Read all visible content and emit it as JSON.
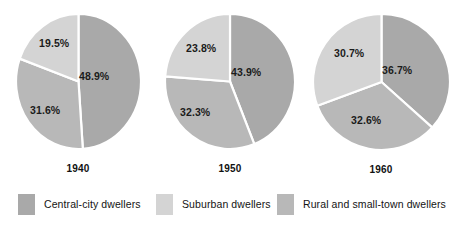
{
  "chart_data": {
    "type": "pie",
    "title": "",
    "subtitle": "",
    "xlabel": "",
    "ylabel": "",
    "legend_position": "bottom",
    "grid": false,
    "categories": [
      "Central-city dwellers",
      "Suburban dwellers",
      "Rural and small-town dwellers"
    ],
    "colors": [
      "#a9a9a9",
      "#d4d4d4",
      "#b8b8b8"
    ],
    "divider_color": "#ffffff",
    "charts": [
      {
        "label": "1940",
        "slices": [
          {
            "category": "Central-city dwellers",
            "value": 48.9,
            "display": "48.9%"
          },
          {
            "category": "Rural and small-town dwellers",
            "value": 31.6,
            "display": "31.6%"
          },
          {
            "category": "Suburban dwellers",
            "value": 19.5,
            "display": "19.5%"
          }
        ]
      },
      {
        "label": "1950",
        "slices": [
          {
            "category": "Central-city dwellers",
            "value": 43.9,
            "display": "43.9%"
          },
          {
            "category": "Rural and small-town dwellers",
            "value": 32.3,
            "display": "32.3%"
          },
          {
            "category": "Suburban dwellers",
            "value": 23.8,
            "display": "23.8%"
          }
        ]
      },
      {
        "label": "1960",
        "slices": [
          {
            "category": "Central-city dwellers",
            "value": 36.7,
            "display": "36.7%"
          },
          {
            "category": "Rural and small-town dwellers",
            "value": 32.6,
            "display": "32.6%"
          },
          {
            "category": "Suburban dwellers",
            "value": 30.7,
            "display": "30.7%"
          }
        ]
      }
    ]
  },
  "pies": [
    {
      "year": "1940",
      "p1": "48.9%",
      "p2": "31.6%",
      "p3": "19.5%"
    },
    {
      "year": "1950",
      "p1": "43.9%",
      "p2": "32.3%",
      "p3": "23.8%"
    },
    {
      "year": "1960",
      "p1": "36.7%",
      "p2": "32.6%",
      "p3": "30.7%"
    }
  ],
  "legend": {
    "items": [
      {
        "label": "Central-city dwellers",
        "color": "#a9a9a9"
      },
      {
        "label": "Suburban dwellers",
        "color": "#d4d4d4"
      },
      {
        "label": "Rural and small-town dwellers",
        "color": "#b8b8b8"
      }
    ]
  }
}
